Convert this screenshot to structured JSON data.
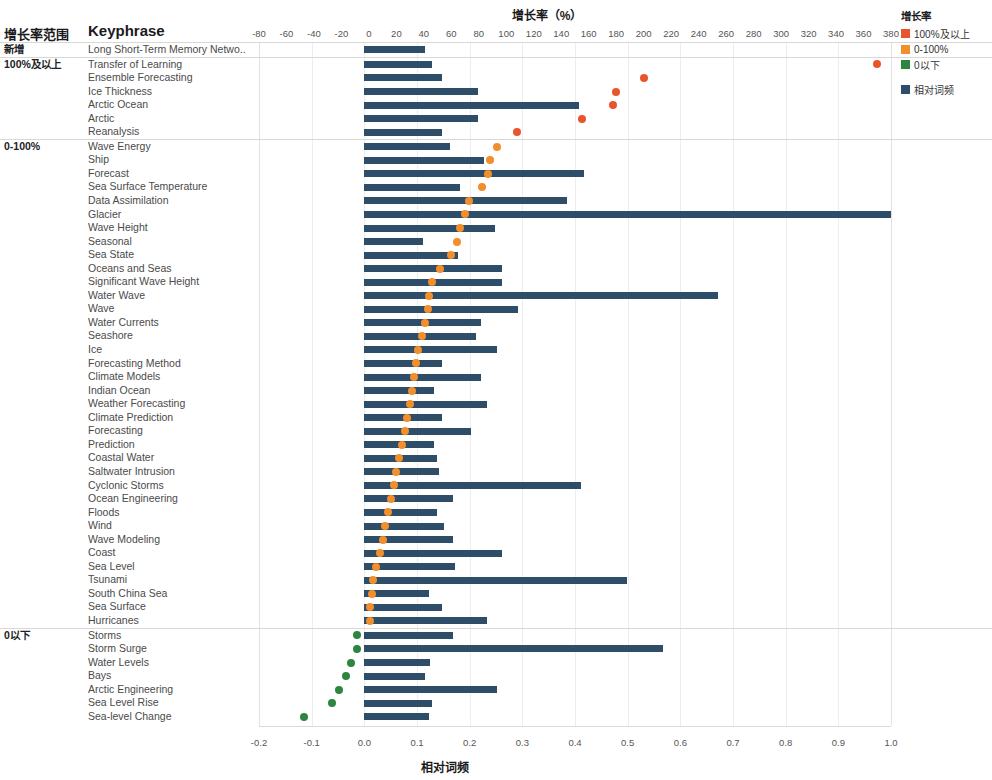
{
  "header": {
    "group_col": "增长率范围",
    "keyphrase_col": "Keyphrase"
  },
  "axes": {
    "top_title": "增长率（%）",
    "bottom_title": "相对词频",
    "top_ticks": [
      -80,
      -60,
      -40,
      -20,
      0,
      20,
      40,
      60,
      80,
      100,
      120,
      140,
      160,
      180,
      200,
      220,
      240,
      260,
      280,
      300,
      320,
      340,
      360,
      380
    ],
    "bottom_ticks": [
      "-0.2",
      "-0.1",
      "0.0",
      "0.1",
      "0.2",
      "0.3",
      "0.4",
      "0.5",
      "0.6",
      "0.7",
      "0.8",
      "0.9",
      "1.0"
    ]
  },
  "legend": {
    "title": "增长率",
    "items": [
      {
        "label": "100%及以上",
        "color": "#e8552d"
      },
      {
        "label": "0-100%",
        "color": "#f28e2b"
      },
      {
        "label": "0以下",
        "color": "#2e8540"
      }
    ],
    "bar_item": {
      "label": "相对词频",
      "color": "#2e4d68"
    }
  },
  "colors": {
    "bar": "#2e4d68",
    "above100": "#e8552d",
    "zero_to_100": "#f28e2b",
    "below0": "#2e8540"
  },
  "chart_data": {
    "type": "bar",
    "title": "增长率（%）",
    "xlabel": "相对词频",
    "ylabel": "Keyphrase",
    "grid": true,
    "legend_position": "right",
    "freq_axis": {
      "label": "相对词频",
      "min": -0.2,
      "max": 1.0
    },
    "growth_axis": {
      "label": "增长率（%）",
      "min": -80,
      "max": 380
    },
    "groups": [
      {
        "name": "新增",
        "rows": [
          {
            "keyphrase": "Long Short-Term Memory Netwo..",
            "freq": 0.115,
            "growth": null,
            "growth_class": "none"
          }
        ]
      },
      {
        "name": "100%及以上",
        "rows": [
          {
            "keyphrase": "Transfer of Learning",
            "freq": 0.128,
            "growth": 370,
            "growth_class": "above100"
          },
          {
            "keyphrase": "Ensemble Forecasting",
            "freq": 0.148,
            "growth": 200,
            "growth_class": "above100"
          },
          {
            "keyphrase": "Ice Thickness",
            "freq": 0.216,
            "growth": 180,
            "growth_class": "above100"
          },
          {
            "keyphrase": "Arctic Ocean",
            "freq": 0.408,
            "growth": 178,
            "growth_class": "above100"
          },
          {
            "keyphrase": "Arctic",
            "freq": 0.216,
            "growth": 155,
            "growth_class": "above100"
          },
          {
            "keyphrase": "Reanalysis",
            "freq": 0.148,
            "growth": 108,
            "growth_class": "above100"
          }
        ]
      },
      {
        "name": "0-100%",
        "rows": [
          {
            "keyphrase": "Wave Energy",
            "freq": 0.162,
            "growth": 93,
            "growth_class": "zero_to_100"
          },
          {
            "keyphrase": "Ship",
            "freq": 0.228,
            "growth": 88,
            "growth_class": "zero_to_100"
          },
          {
            "keyphrase": "Forecast",
            "freq": 0.418,
            "growth": 87,
            "growth_class": "zero_to_100"
          },
          {
            "keyphrase": "Sea Surface Temperature",
            "freq": 0.182,
            "growth": 82,
            "growth_class": "zero_to_100"
          },
          {
            "keyphrase": "Data Assimilation",
            "freq": 0.385,
            "growth": 73,
            "growth_class": "zero_to_100"
          },
          {
            "keyphrase": "Glacier",
            "freq": 1.0,
            "growth": 70,
            "growth_class": "zero_to_100"
          },
          {
            "keyphrase": "Wave Height",
            "freq": 0.248,
            "growth": 66,
            "growth_class": "zero_to_100"
          },
          {
            "keyphrase": "Seasonal",
            "freq": 0.112,
            "growth": 64,
            "growth_class": "zero_to_100"
          },
          {
            "keyphrase": "Sea State",
            "freq": 0.178,
            "growth": 60,
            "growth_class": "zero_to_100"
          },
          {
            "keyphrase": "Oceans and Seas",
            "freq": 0.262,
            "growth": 52,
            "growth_class": "zero_to_100"
          },
          {
            "keyphrase": "Significant Wave Height",
            "freq": 0.262,
            "growth": 46,
            "growth_class": "zero_to_100"
          },
          {
            "keyphrase": "Water Wave",
            "freq": 0.672,
            "growth": 44,
            "growth_class": "zero_to_100"
          },
          {
            "keyphrase": "Wave",
            "freq": 0.292,
            "growth": 43,
            "growth_class": "zero_to_100"
          },
          {
            "keyphrase": "Water Currents",
            "freq": 0.222,
            "growth": 41,
            "growth_class": "zero_to_100"
          },
          {
            "keyphrase": "Seashore",
            "freq": 0.212,
            "growth": 39,
            "growth_class": "zero_to_100"
          },
          {
            "keyphrase": "Ice",
            "freq": 0.252,
            "growth": 36,
            "growth_class": "zero_to_100"
          },
          {
            "keyphrase": "Forecasting Method",
            "freq": 0.148,
            "growth": 34,
            "growth_class": "zero_to_100"
          },
          {
            "keyphrase": "Climate Models",
            "freq": 0.222,
            "growth": 33,
            "growth_class": "zero_to_100"
          },
          {
            "keyphrase": "Indian Ocean",
            "freq": 0.132,
            "growth": 31,
            "growth_class": "zero_to_100"
          },
          {
            "keyphrase": "Weather Forecasting",
            "freq": 0.232,
            "growth": 30,
            "growth_class": "zero_to_100"
          },
          {
            "keyphrase": "Climate Prediction",
            "freq": 0.148,
            "growth": 28,
            "growth_class": "zero_to_100"
          },
          {
            "keyphrase": "Forecasting",
            "freq": 0.202,
            "growth": 26,
            "growth_class": "zero_to_100"
          },
          {
            "keyphrase": "Prediction",
            "freq": 0.132,
            "growth": 24,
            "growth_class": "zero_to_100"
          },
          {
            "keyphrase": "Coastal Water",
            "freq": 0.138,
            "growth": 22,
            "growth_class": "zero_to_100"
          },
          {
            "keyphrase": "Saltwater Intrusion",
            "freq": 0.142,
            "growth": 20,
            "growth_class": "zero_to_100"
          },
          {
            "keyphrase": "Cyclonic Storms",
            "freq": 0.412,
            "growth": 18,
            "growth_class": "zero_to_100"
          },
          {
            "keyphrase": "Ocean Engineering",
            "freq": 0.168,
            "growth": 16,
            "growth_class": "zero_to_100"
          },
          {
            "keyphrase": "Floods",
            "freq": 0.138,
            "growth": 14,
            "growth_class": "zero_to_100"
          },
          {
            "keyphrase": "Wind",
            "freq": 0.152,
            "growth": 12,
            "growth_class": "zero_to_100"
          },
          {
            "keyphrase": "Wave Modeling",
            "freq": 0.168,
            "growth": 10,
            "growth_class": "zero_to_100"
          },
          {
            "keyphrase": "Coast",
            "freq": 0.262,
            "growth": 8,
            "growth_class": "zero_to_100"
          },
          {
            "keyphrase": "Sea Level",
            "freq": 0.172,
            "growth": 5,
            "growth_class": "zero_to_100"
          },
          {
            "keyphrase": "Tsunami",
            "freq": 0.498,
            "growth": 3,
            "growth_class": "zero_to_100"
          },
          {
            "keyphrase": "South China Sea",
            "freq": 0.122,
            "growth": 2,
            "growth_class": "zero_to_100"
          },
          {
            "keyphrase": "Sea Surface",
            "freq": 0.148,
            "growth": 1,
            "growth_class": "zero_to_100"
          },
          {
            "keyphrase": "Hurricanes",
            "freq": 0.232,
            "growth": 1,
            "growth_class": "zero_to_100"
          }
        ]
      },
      {
        "name": "0以下",
        "rows": [
          {
            "keyphrase": "Storms",
            "freq": 0.168,
            "growth": -9,
            "growth_class": "below0"
          },
          {
            "keyphrase": "Storm Surge",
            "freq": 0.568,
            "growth": -9,
            "growth_class": "below0"
          },
          {
            "keyphrase": "Water Levels",
            "freq": 0.125,
            "growth": -13,
            "growth_class": "below0"
          },
          {
            "keyphrase": "Bays",
            "freq": 0.115,
            "growth": -17,
            "growth_class": "below0"
          },
          {
            "keyphrase": "Arctic Engineering",
            "freq": 0.252,
            "growth": -22,
            "growth_class": "below0"
          },
          {
            "keyphrase": "Sea Level Rise",
            "freq": 0.128,
            "growth": -27,
            "growth_class": "below0"
          },
          {
            "keyphrase": "Sea-level Change",
            "freq": 0.122,
            "growth": -47,
            "growth_class": "below0"
          }
        ]
      }
    ]
  }
}
